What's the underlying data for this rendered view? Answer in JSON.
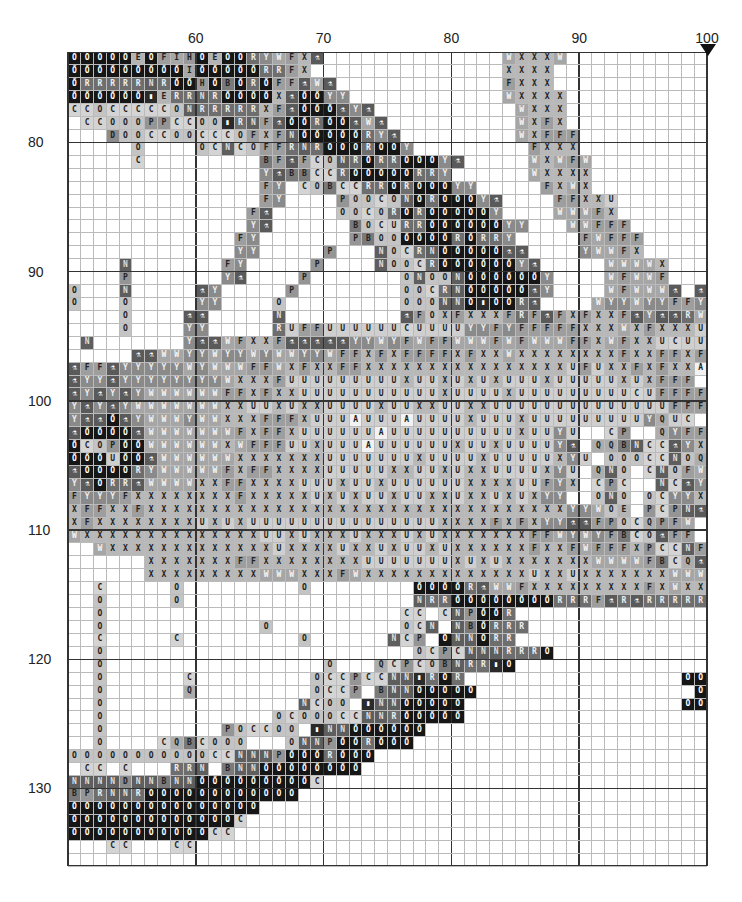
{
  "chart_data": {
    "type": "heatmap",
    "title": "",
    "col_start": 50,
    "row_start": 73,
    "cols": 50,
    "rows": 63,
    "column_labels": [
      {
        "value": "60",
        "col": 60
      },
      {
        "value": "70",
        "col": 70
      },
      {
        "value": "80",
        "col": 80
      },
      {
        "value": "90",
        "col": 90
      },
      {
        "value": "100",
        "col": 100
      }
    ],
    "row_labels": [
      {
        "value": "80",
        "row": 80
      },
      {
        "value": "90",
        "row": 90
      },
      {
        "value": "100",
        "row": 100
      },
      {
        "value": "110",
        "row": 110
      },
      {
        "value": "120",
        "row": 120
      },
      {
        "value": "130",
        "row": 130
      }
    ],
    "center_marker": {
      "col": 100,
      "icon": "down-triangle-icon"
    },
    "legend_symbols": {
      "@": "swirl",
      "%": "robot",
      "!": "vial",
      "W": "W",
      "X": "X",
      "F": "F",
      "U": "U",
      "Y": "Y",
      "R": "R",
      "N": "N",
      "B": "B",
      "C": "C",
      "O": "O",
      "Q": "Q",
      "P": "P",
      "E": "E",
      "I": "I",
      "H": "H",
      "D": "D",
      "A": "A",
      "T": "T"
    },
    "grid": [
      "@@@@@E@FIH@E@@RYWFX%..............WXXXW...............",
      "@@@@@@@@@I@@@@@RRFX...............XXXX................",
      "@RRRRRNR@@H@B@R@FF%W%.............FXXX................",
      "@@@@@@!ERRNR@@@@X%@@YY............WXXXX...............",
      "CCOCCCCCONRRRRRXF%@@@%Y%...........WXXX...............",
      ".CCOOOPPCCOO!RNF%@@R@@%W%..........WXFX...............",
      "...DOOCCOOCCCOFXFN@@@@@RY%.........WXFFF..............",
      ".....O....OCNCOFFRNR@@@R@@Y.........FXXX..............",
      ".....C.........BF%FCONR@RR@@@Y%.....WXWFW.............",
      "...............Y%BBCCR@@@@@RRY......WXXXX.............",
      "...............FY.COBCCRR@R@@@YY.....FXWX.............",
      "...............FY....POOCON@R@@@Y%....FFXXU............",
      "..............F%.....OOCOR@R@@@@@Y....WWWFX...........",
      "..............Y%......BOCURR@@@@@@YY...WWFFF..........",
      ".............FY.......PBOO@@@@R@RRY.....FWFFF..........",
      ".............YY.....P...NOCRN@@@@@%%....YWWFX.........",
      "....N.......FY.....P....NOOCR@@@@@@Y%.....WWWWX.......",
      "....P.......Y%....P.......ONOON@@@@@@Y....WFWWF.......",
      "O...N.....%Y.....P........OOCRN@@@@@%Y....WFWWW%.%%%%%%Y",
      "O...O.....YY....O.........OOONN@!@@R%....WYYWYYFFYFYYY",
      "....O....%%.....N.........%FOXFXXXFRF%FXFXXF%Y%%RWFYY",
      "....O....YY.....RUFFUUUUUUCUUUUYYFYFFFFFXXXWXFXXXUUUXF..",
      ".N.......Y%%WFXXF%%%%%YYWYFWFFWWWFWFWWWFFXWFXXUCUU",
      ".....%%WWYYWYYWYWWYYWFFXFXFFFFXFXXWXXXXXXXXFXXFFXFUC",
      "%FF%YYYYYWYWWWFFWXFXXFFXXXXXXXXXXXXXXXXUFUXXFXFXXA",
      "%YY%YYYYYYYYWXXXFUUUUUUUUUXUUXUXUXUUUXUUUUUXUXFFF",
      "%Y%Y%YWWWWWWFFXFXXUUUUUUUUUUUXUUUUXUUUUUUUUUCUFFFFFU",
      "Y%Y%YWWWWWWWXXUUXUXXUUUUXUUXXUUXXUUUUUUUUUUUUUUFFF",
      "Y%%@%YWWWYWWXXXFFFXUUUAUUUAUUUUXUUUXUUUUUUUUUYQUC..FFWFF",
      "%@@@@%WWWWWWWFXFFXUUUUUUAUUUUUUUUUUXUUYU..CP..QYFF",
      "@COP@@WWWWWWXWFFFUUXUUUAUUUUUUXUUXUUUUY%.QQBNCC%YX",
      "@@@U@@%WWWWWWXXXXXXXUUUUUUUXUUUUXUUUUUXYU.OOOCCNOQYF",
      "%@@@@RYWWWWWFXFFXXXXUUUUUXXUUXUXXUUUUXYU.QNO.CNOFWF",
      "Y%@RR%WWWWXXFFXXXXUUUXUUXUUUUUUXXXXUUFYX.CPC..NC%YF",
      "FYYYFXXXXXXXXFXXXXXUXUXUUXUUXXUXXUXUXYY..ONO.OCYYX",
      "XFFXXFXXXXXXXXXXXXXXXXXXXXXXXXXXXXXXXXXYYWOE.PCPN%FX",
      "XFXXXXXXXXUXUXUUUUUUUUUUUUUUUXXXXFXFXYY%%FPOCQPFW",
      "WXXXXXXXXXXXXXXUUXUXXXUXXXUXUXXXXXXXFFWYWYFBCO%FF",
      "..WXXXXXXXXXXXXXUXXXXUXXUXUUXUXXXXXXFXXFWFFFXPCCNFU",
      "......XXXXXXXFFXXXXXXXXUUUUUUUXUXUXXXXXXXWWWWFBCQ%X",
      "......XXXXXXXXXWWWXXXFWXXXXXXXXXXXXXUXXUXXXXXXXWWWXNCCO.",
      "..C.....O.........O........@@@@R%WWFXXXXXXXXXFXWXXWWWWWN.B.",
      "..O.....O..................NRR@@@@@@@@RRRF%R%RRRRR.......QCO.",
      "..O.......................CC.CNP@@R....................PCN",
      "..O............O..........OCN.NB@RRR...................PCC",
      "..C.....C.........O......NCP.@NN@RR.....................O.",
      "..O........................OCPCNNNRRR@...................R.",
      "..O.................O...QCPCOBNRR!@..................@@@@@",
      "..O......C.........OCCPCCNN!R@R.................@@@@@O",
      "..O......Q.........OCCP.BNN@@@@@.................@@@@@@",
      "..O...............NCOO.!NN@@@@@.................@@CC...",
      "..O.............OCOOOCCNNR@@@@@..........................",
      "..O.........POCCOO.!NN@@@@@@.............................",
      "..O....CQBCOOO...ONNP@@R@@@..............................",
      "OOOOOOOOOOOCCNNNP@@@R@@@.................................",
      ".CC.C...RRN.BNN@@@@@@@@..................................",
      "NNNNDNNBNN@@@@@@@@@C.....................................",
      "BPRNNR@@@@@@@@@@@@.......................................",
      "@@@@@@@@@@@@@@@..........................................",
      "@@@@@@@@@@@@@C...........................................",
      "@@@@@@@@@@@CC............................................",
      "...CC...CC...............................................",
      ".................................................."
    ]
  },
  "colors": {
    "@": "#161616",
    "%": "#5a5a5a",
    "!": "#2a2a2a",
    "R": "#6e6e6e",
    "N": "#5e5e5e",
    "B": "#7a7a7a",
    "H": "#9a9a9a",
    "I": "#a8a8a8",
    "E": "#b4b4b4",
    "D": "#8c8c8c",
    "X": "#b8b8b8",
    "F": "#9e9e9e",
    "U": "#cfcfcf",
    "W": "#a6a6a6",
    "Y": "#8a8a8a",
    "C": "#d4d4d4",
    "O": "#c4c4c4",
    "Q": "#adadad",
    "P": "#959595",
    "A": "#f2f2f2",
    "T": "#888"
  },
  "text_colors": {
    "@": "#fff",
    "%": "#fff",
    "!": "#fff",
    "N": "#ddd",
    "R": "#eee",
    "Y": "#eee",
    "W": "#f5f5f5",
    "H": "#222"
  }
}
